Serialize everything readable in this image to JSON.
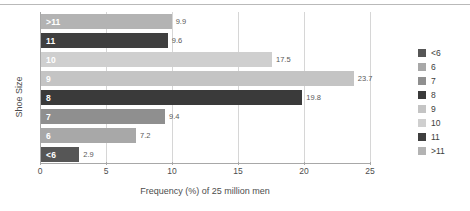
{
  "chart_data": {
    "type": "bar",
    "orientation": "horizontal",
    "title": "",
    "xlabel": "Frequency (%) of 25 million men",
    "ylabel": "Shoe Size",
    "categories": [
      ">11",
      "11",
      "10",
      "9",
      "8",
      "7",
      "6",
      "<6"
    ],
    "values": [
      9.9,
      9.6,
      17.5,
      23.7,
      19.8,
      9.4,
      7.2,
      2.9
    ],
    "value_labels": [
      "9.9",
      "9.6",
      "17.5",
      "23.7",
      "19.8",
      "9.4",
      "7.2",
      "2.9"
    ],
    "bar_colors": [
      "#b3b3b3",
      "#3f3f3f",
      "#cfcfcf",
      "#c4c4c4",
      "#3a3a3a",
      "#8f8f8f",
      "#a8a8a8",
      "#565656"
    ],
    "xlim": [
      0,
      25
    ],
    "xticks": [
      0,
      5,
      10,
      15,
      20,
      25
    ],
    "xtick_labels": [
      "0",
      "5",
      "10",
      "15",
      "20",
      "25"
    ],
    "grid": true,
    "legend_position": "right",
    "legend": {
      "entries": [
        {
          "label": "<6",
          "color": "#565656"
        },
        {
          "label": "6",
          "color": "#a8a8a8"
        },
        {
          "label": "7",
          "color": "#8f8f8f"
        },
        {
          "label": "8",
          "color": "#3a3a3a"
        },
        {
          "label": "9",
          "color": "#c4c4c4"
        },
        {
          "label": "10",
          "color": "#cfcfcf"
        },
        {
          "label": "11",
          "color": "#3f3f3f"
        },
        {
          "label": ">11",
          "color": "#b3b3b3"
        }
      ]
    }
  }
}
